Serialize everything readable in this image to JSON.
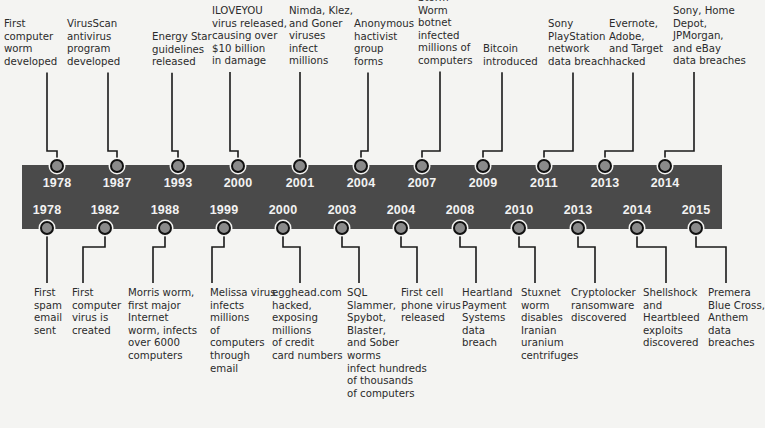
{
  "colors": {
    "band": "#4a4a4a",
    "dot_fill": "#8a8a8a",
    "line": "#1a1a1a",
    "background": "#f4f4f2",
    "year_text": "#f2f2f2"
  },
  "top_events": [
    {
      "year": "1978",
      "text": "First\ncomputer\nworm\ndeveloped",
      "dot_x": 57,
      "text_x": 4,
      "text_y": 6,
      "stem_x": 47
    },
    {
      "year": "1987",
      "text": "VirusScan\nantivirus\nprogram\ndeveloped",
      "dot_x": 117,
      "text_x": 67,
      "text_y": 6,
      "stem_x": 108
    },
    {
      "year": "1993",
      "text": "Energy Star\nguidelines\nreleased",
      "dot_x": 178,
      "text_x": 152,
      "text_y": 19,
      "stem_x": 172
    },
    {
      "year": "2000",
      "text": "ILOVEYOU\nvirus released,\ncausing over\n$10 billion\nin damage",
      "dot_x": 238,
      "text_x": 212,
      "text_y": -7,
      "stem_x": 230
    },
    {
      "year": "2001",
      "text": "Nimda, Klez,\nand Goner\nviruses\ninfect\nmillions",
      "dot_x": 300,
      "text_x": 289,
      "text_y": -7,
      "stem_x": 300
    },
    {
      "year": "2004",
      "text": "Anonymous\nhactivist\ngroup\nforms",
      "dot_x": 361,
      "text_x": 354,
      "text_y": 6,
      "stem_x": 368
    },
    {
      "year": "2007",
      "text": "Storm\nWorm\nbotnet\ninfected\nmillions of\ncomputers",
      "dot_x": 422,
      "text_x": 418,
      "text_y": -20,
      "stem_x": 440
    },
    {
      "year": "2009",
      "text": "Bitcoin\nintroduced",
      "dot_x": 483,
      "text_x": 483,
      "text_y": 31,
      "stem_x": 502
    },
    {
      "year": "2011",
      "text": "Sony\nPlayStation\nnetwork\ndata breach",
      "dot_x": 544,
      "text_x": 548,
      "text_y": 6,
      "stem_x": 573
    },
    {
      "year": "2013",
      "text": "Evernote,\nAdobe,\nand Target\nhacked",
      "dot_x": 605,
      "text_x": 609,
      "text_y": 6,
      "stem_x": 633
    },
    {
      "year": "2014",
      "text": "Sony, Home\nDepot,\nJPMorgan,\nand eBay\ndata breaches",
      "dot_x": 665,
      "text_x": 673,
      "text_y": -7,
      "stem_x": 694
    }
  ],
  "bottom_events": [
    {
      "year": "1978",
      "text": "First\nspam\nemail\nsent",
      "dot_x": 47,
      "text_x": 34,
      "stem_x": 47
    },
    {
      "year": "1982",
      "text": "First\ncomputer\nvirus is\ncreated",
      "dot_x": 105,
      "text_x": 72,
      "stem_x": 83
    },
    {
      "year": "1988",
      "text": "Morris worm,\nfirst major\nInternet\nworm, infects\nover 6000\ncomputers",
      "dot_x": 165,
      "text_x": 128,
      "stem_x": 153
    },
    {
      "year": "1999",
      "text": "Melissa virus\ninfects\nmillions\nof\ncomputers\nthrough\nemail",
      "dot_x": 224,
      "text_x": 210,
      "stem_x": 212
    },
    {
      "year": "2000",
      "text": "egghead.com\nhacked,\nexposing\nmillions\nof credit\ncard numbers",
      "dot_x": 283,
      "text_x": 272,
      "stem_x": 300
    },
    {
      "year": "2003",
      "text": "SQL\nSlammer,\nSpybot,\nBlaster,\nand Sober\nworms\ninfect hundreds\nof thousands\nof computers",
      "dot_x": 342,
      "text_x": 347,
      "stem_x": 359
    },
    {
      "year": "2004",
      "text": "First cell\nphone virus\nreleased",
      "dot_x": 401,
      "text_x": 401,
      "stem_x": 417
    },
    {
      "year": "2008",
      "text": "Heartland\nPayment\nSystems\ndata\nbreach",
      "dot_x": 460,
      "text_x": 462,
      "stem_x": 476
    },
    {
      "year": "2010",
      "text": "Stuxnet\nworm\ndisables\nIranian\nuranium\ncentrifuges",
      "dot_x": 519,
      "text_x": 521,
      "stem_x": 535
    },
    {
      "year": "2013",
      "text": "Cryptolocker\nransomware\ndiscovered",
      "dot_x": 578,
      "text_x": 571,
      "stem_x": 595
    },
    {
      "year": "2014",
      "text": "Shellshock\nand\nHeartbleed\nexploits\ndiscovered",
      "dot_x": 637,
      "text_x": 643,
      "stem_x": 666
    },
    {
      "year": "2015",
      "text": "Premera\nBlue Cross,\nAnthem\ndata\nbreaches",
      "dot_x": 696,
      "text_x": 708,
      "stem_x": 726
    }
  ]
}
